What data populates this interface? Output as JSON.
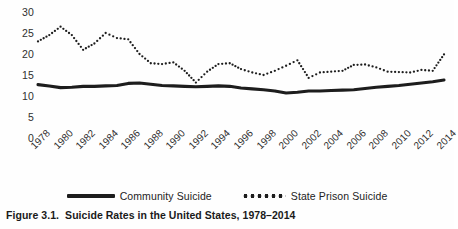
{
  "figure": {
    "caption_number": "Figure 3.1.",
    "caption_text": "Suicide Rates in the United States, 1978–2014"
  },
  "legend": {
    "position": "bottom-center",
    "entries": [
      {
        "label": "Community Suicide",
        "marker": "solid-line",
        "color": "#1d1d1d"
      },
      {
        "label": "State Prison Suicide",
        "marker": "dotted-line",
        "color": "#1d1d1d"
      }
    ]
  },
  "chart_data": {
    "type": "line",
    "title": "Suicide Rates in the United States, 1978–2014",
    "subtitle": "",
    "xlabel": "",
    "ylabel": "",
    "grid": false,
    "legend_position": "bottom-center",
    "xlim": [
      1978,
      2014
    ],
    "ylim": [
      0,
      30
    ],
    "ytick_labels": [
      "30",
      "25",
      "20",
      "15",
      "10",
      "5",
      "0"
    ],
    "ytick_values": [
      30,
      25,
      20,
      15,
      10,
      5,
      0
    ],
    "xtick_labels": [
      "1978",
      "1980",
      "1982",
      "1984",
      "1986",
      "1988",
      "1990",
      "1992",
      "1994",
      "1996",
      "1998",
      "2000",
      "2002",
      "2004",
      "2006",
      "2008",
      "2010",
      "2012",
      "2014"
    ],
    "xtick_values": [
      1978,
      1980,
      1982,
      1984,
      1986,
      1988,
      1990,
      1992,
      1994,
      1996,
      1998,
      2000,
      2002,
      2004,
      2006,
      2008,
      2010,
      2012,
      2014
    ],
    "x": [
      1978,
      1979,
      1980,
      1981,
      1982,
      1983,
      1984,
      1985,
      1986,
      1987,
      1988,
      1989,
      1990,
      1991,
      1992,
      1993,
      1994,
      1995,
      1996,
      1997,
      1998,
      1999,
      2000,
      2001,
      2002,
      2003,
      2004,
      2005,
      2006,
      2007,
      2008,
      2009,
      2010,
      2011,
      2012,
      2013,
      2014
    ],
    "series": [
      {
        "name": "Community Suicide",
        "style": "solid",
        "color": "#1d1d1d",
        "values": [
          12.7,
          12.4,
          12.0,
          12.1,
          12.3,
          12.3,
          12.4,
          12.5,
          13.0,
          13.1,
          12.8,
          12.5,
          12.4,
          12.3,
          12.2,
          12.3,
          12.4,
          12.3,
          11.9,
          11.7,
          11.5,
          11.2,
          10.7,
          10.9,
          11.2,
          11.2,
          11.3,
          11.4,
          11.5,
          11.8,
          12.1,
          12.3,
          12.5,
          12.8,
          13.1,
          13.4,
          13.8
        ]
      },
      {
        "name": "State Prison Suicide",
        "style": "dotted",
        "color": "#1d1d1d",
        "values": [
          23.0,
          24.5,
          26.5,
          24.5,
          21.0,
          22.5,
          25.0,
          23.8,
          23.5,
          20.0,
          17.8,
          17.6,
          18.0,
          16.0,
          13.2,
          15.8,
          17.6,
          17.8,
          16.4,
          15.6,
          15.0,
          16.0,
          17.2,
          18.5,
          14.3,
          15.6,
          15.8,
          16.0,
          17.4,
          17.5,
          16.8,
          15.8,
          15.7,
          15.6,
          16.2,
          16.0,
          19.9
        ]
      }
    ]
  }
}
